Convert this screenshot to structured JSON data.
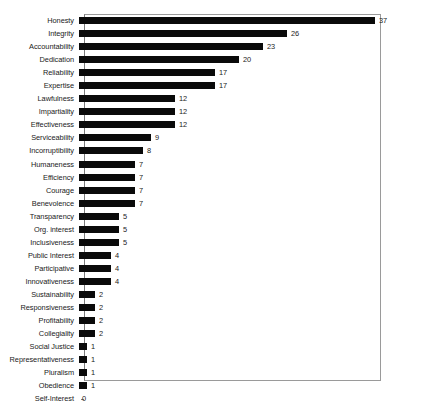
{
  "chart_data": {
    "type": "bar",
    "orientation": "horizontal",
    "title": "",
    "subtitle": "",
    "xlabel": "",
    "ylabel": "",
    "xlim": [
      0,
      37
    ],
    "grid": false,
    "legend": null,
    "show_value_labels": true,
    "axis_ticks_visible": true,
    "categories": [
      "Honesty",
      "Integrity",
      "Accountability",
      "Dedication",
      "Reliability",
      "Expertise",
      "Lawfulness",
      "Impartiality",
      "Effectiveness",
      "Serviceability",
      "Incorruptibility",
      "Humaneness",
      "Efficiency",
      "Courage",
      "Benevolence",
      "Transparency",
      "Org. interest",
      "Inclusiveness",
      "Public Interest",
      "Participative",
      "Innovativeness",
      "Sustainability",
      "Responsiveness",
      "Profitability",
      "Collegiality",
      "Social Justice",
      "Representativeness",
      "Pluralism",
      "Obedience",
      "Self-Interest"
    ],
    "values": [
      37,
      26,
      23,
      20,
      17,
      17,
      12,
      12,
      12,
      9,
      8,
      7,
      7,
      7,
      7,
      5,
      5,
      5,
      4,
      4,
      4,
      2,
      2,
      2,
      2,
      1,
      1,
      1,
      1,
      0
    ],
    "colors": {
      "bar": "#0a0a0a",
      "frame": "#9a9a9a",
      "text": "#1a1a1a",
      "background": "#ffffff"
    }
  }
}
